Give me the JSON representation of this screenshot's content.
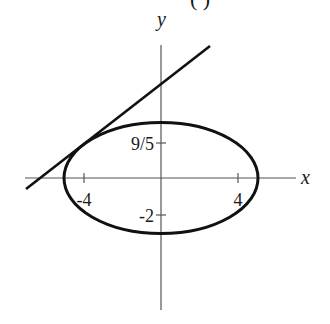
{
  "diagram": {
    "header_fragment": "( )",
    "axes": {
      "x_label": "x",
      "y_label": "y"
    },
    "ticks": {
      "x_neg": "-4",
      "x_pos": "4",
      "y_pos": "9/5",
      "y_neg": "-2"
    },
    "ellipse": {
      "a": 5,
      "b": 3,
      "equation": "x^2/25 + y^2/9 = 1"
    },
    "tangent_line": {
      "description": "tangent line touching ellipse at upper-left"
    },
    "colors": {
      "stroke": "#111111",
      "axis": "#555555",
      "background": "#ffffff"
    }
  }
}
